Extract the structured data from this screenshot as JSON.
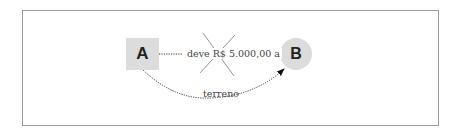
{
  "diagram": {
    "nodes": [
      {
        "id": "A",
        "label": "A",
        "shape": "square",
        "fill": "#dcdcdc"
      },
      {
        "id": "B",
        "label": "B",
        "shape": "circle",
        "fill": "#dcdcdc"
      }
    ],
    "edges": [
      {
        "from": "A",
        "to": "B",
        "label": "deve R$ 5.000,00 a",
        "style": "dotted-straight",
        "crossed_out": true
      },
      {
        "from": "A",
        "to": "B",
        "label": "terreno",
        "style": "dotted-curved",
        "crossed_out": false
      }
    ],
    "colors": {
      "border": "#9a9a9a",
      "node_fill": "#dcdcdc",
      "line": "#333333",
      "cross": "#777777"
    }
  }
}
